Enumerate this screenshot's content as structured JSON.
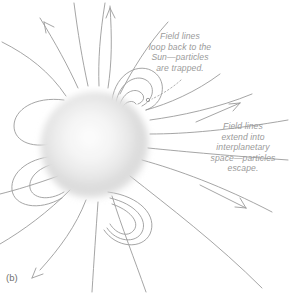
{
  "figure": {
    "caption": "(b)",
    "background_color": "#ffffff",
    "line_color": "#9b9b9b",
    "text_color": "#9a9a9a",
    "sun": {
      "name": "sun-sphere",
      "center_x": 95,
      "center_y": 146,
      "radius": 56,
      "core_color": "#fbfbfb",
      "edge_color": "#c9c9c9"
    },
    "annotations": [
      {
        "id": "trapped",
        "text": "Field lines\nloop back to the\nSun—particles\nare trapped."
      },
      {
        "id": "escape",
        "text": "Field lines\nextend into\ninterplanetary\nspace—particles\nescape."
      }
    ]
  }
}
